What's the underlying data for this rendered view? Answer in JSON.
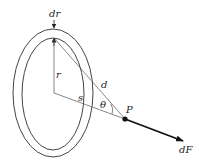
{
  "diagram": {
    "type": "ring-force-geometry",
    "labels": {
      "dr": "dr",
      "r": "r",
      "d": "d",
      "s": "s",
      "theta": "θ",
      "P": "P",
      "dF": "dF"
    },
    "colors": {
      "stroke": "#333333",
      "thin_line": "#555555",
      "arrow": "#111111",
      "background": "#ffffff"
    }
  }
}
